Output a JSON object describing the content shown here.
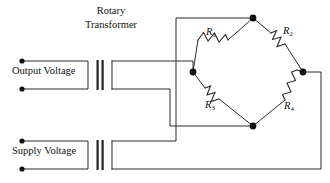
{
  "diagram": {
    "type": "circuit-schematic",
    "title": {
      "line1": "Rotary",
      "line2": "Transformer"
    },
    "ports": [
      {
        "id": "output-voltage",
        "label": "Output Voltage",
        "position": "top-left",
        "terminals": 2
      },
      {
        "id": "supply-voltage",
        "label": "Supply Voltage",
        "position": "bottom-left",
        "terminals": 2
      }
    ],
    "transformers": [
      {
        "id": "rotary-transformer-top",
        "label": "Rotary Transformer",
        "core_bars": 2
      },
      {
        "id": "rotary-transformer-bottom",
        "label": "Rotary Transformer",
        "core_bars": 2
      }
    ],
    "bridge": {
      "name": "Wheatstone bridge",
      "resistors": [
        {
          "id": "r1",
          "label": "R",
          "subscript": "1",
          "arm": "top-left"
        },
        {
          "id": "r2",
          "label": "R",
          "subscript": "2",
          "arm": "top-right"
        },
        {
          "id": "r3",
          "label": "R",
          "subscript": "3",
          "arm": "bottom-left"
        },
        {
          "id": "r4",
          "label": "R",
          "subscript": "4",
          "arm": "bottom-right"
        }
      ],
      "nodes": [
        {
          "id": "node-top",
          "x": 253,
          "y": 18
        },
        {
          "id": "node-left",
          "x": 193,
          "y": 72
        },
        {
          "id": "node-right",
          "x": 303,
          "y": 72
        },
        {
          "id": "node-bottom",
          "x": 253,
          "y": 126
        }
      ]
    },
    "colors": {
      "wire": "#2b2b2b",
      "node": "#111111",
      "background": "#ffffff",
      "text": "#111111"
    }
  }
}
